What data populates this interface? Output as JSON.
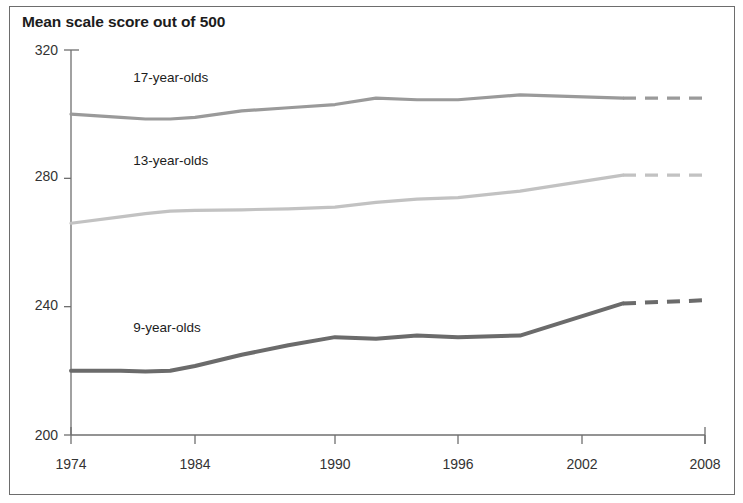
{
  "figure": {
    "title": "Mean scale score out of 500",
    "border_color": "#6d6d6d",
    "background": "#ffffff"
  },
  "chart_data": {
    "type": "line",
    "title": "Mean scale score out of 500",
    "xlabel": "",
    "ylabel": "Mean scale score out of 500",
    "ylim": [
      200,
      320
    ],
    "yticks": [
      200,
      240,
      280,
      320
    ],
    "xticks": [
      1974,
      1984,
      1990,
      1996,
      2002,
      2008
    ],
    "xlim": [
      1974,
      2008
    ],
    "grid": false,
    "legend": "inline-annotations",
    "series": [
      {
        "name": "17-year-olds",
        "color": "#9a9a9a",
        "width": 3.2,
        "label_x": 1979.5,
        "label_y": 311,
        "solid": {
          "x": [
            1974,
            1978,
            1980,
            1982,
            1984,
            1986,
            1988,
            1990,
            1992,
            1994,
            1996,
            1999,
            2004
          ],
          "y": [
            300,
            299,
            298.5,
            298.5,
            299,
            301,
            302,
            303,
            305,
            304.5,
            304.5,
            306,
            305
          ]
        },
        "dashed": {
          "x": [
            2004,
            2008
          ],
          "y": [
            305,
            305
          ]
        }
      },
      {
        "name": "13-year-olds",
        "color": "#c2c2c2",
        "width": 3.2,
        "label_x": 1979.5,
        "label_y": 285,
        "solid": {
          "x": [
            1974,
            1978,
            1980,
            1982,
            1984,
            1986,
            1988,
            1990,
            1992,
            1994,
            1996,
            1999,
            2004
          ],
          "y": [
            266,
            268,
            269,
            269.8,
            270,
            270.2,
            270.5,
            271,
            272.5,
            273.5,
            274,
            276,
            281
          ]
        },
        "dashed": {
          "x": [
            2004,
            2008
          ],
          "y": [
            281,
            281
          ]
        }
      },
      {
        "name": "9-year-olds",
        "color": "#6b6b6b",
        "width": 4.0,
        "label_x": 1979.5,
        "label_y": 233,
        "solid": {
          "x": [
            1974,
            1978,
            1980,
            1982,
            1984,
            1986,
            1988,
            1990,
            1992,
            1994,
            1996,
            1999,
            2004
          ],
          "y": [
            220,
            220,
            219.8,
            220,
            221.5,
            225,
            228,
            230.5,
            230,
            231,
            230.5,
            231,
            241
          ]
        },
        "dashed": {
          "x": [
            2004,
            2008
          ],
          "y": [
            241,
            242
          ]
        }
      }
    ]
  },
  "axes": {
    "y_tick_labels": [
      "320",
      "280",
      "240",
      "200"
    ],
    "x_tick_labels": [
      "1974",
      "1984",
      "1990",
      "1996",
      "2002",
      "2008"
    ]
  }
}
